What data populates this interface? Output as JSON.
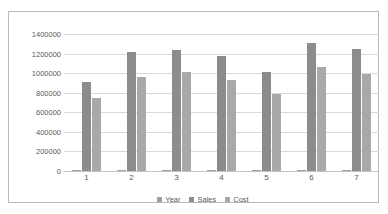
{
  "chart_data": {
    "type": "bar",
    "title": "",
    "subtitle": "",
    "xlabel": "",
    "ylabel": "",
    "categories": [
      "1",
      "2",
      "3",
      "4",
      "5",
      "6",
      "7"
    ],
    "series": [
      {
        "name": "Year",
        "color": "#9f9f9f",
        "values": [
          2010,
          2011,
          2012,
          2013,
          2014,
          2015,
          2016
        ]
      },
      {
        "name": "Sales",
        "color": "#8c8c8c",
        "values": [
          910000,
          1215000,
          1235000,
          1175000,
          1010000,
          1310000,
          1245000
        ]
      },
      {
        "name": "Cost",
        "color": "#a9a9a9",
        "values": [
          750000,
          960000,
          1010000,
          925000,
          790000,
          1065000,
          995000
        ]
      }
    ],
    "ylim": [
      0,
      1400000
    ],
    "ytick_values": [
      0,
      200000,
      400000,
      600000,
      800000,
      1000000,
      1200000,
      1400000
    ],
    "ytick_labels": [
      "0",
      "200000",
      "400000",
      "600000",
      "800000",
      "1000000",
      "1200000",
      "1400000"
    ],
    "grid": true,
    "grid_axis": "y",
    "legend_position": "bottom",
    "background": "#ffffff",
    "border_color": "#b9b9b9",
    "gridline_color": "#d9d9d9",
    "text_color": "#595959"
  }
}
